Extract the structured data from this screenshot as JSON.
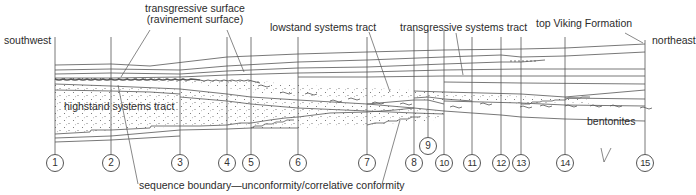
{
  "diagram": {
    "type": "stratigraphic cross-section",
    "labels": {
      "southwest": "southwest",
      "northeast": "northeast",
      "transgressive_surface_line1": "transgressive surface",
      "transgressive_surface_line2": "(ravinement surface)",
      "lowstand": "lowstand systems tract",
      "transgressive_tract": "transgressive systems tract",
      "top_viking": "top Viking Formation",
      "highstand": "highstand systems tract",
      "bentonites": "bentonites",
      "sequence_boundary": "sequence boundary—unconformity/correlative conformity"
    },
    "wells": [
      {
        "id": "1",
        "x": 55
      },
      {
        "id": "2",
        "x": 111
      },
      {
        "id": "3",
        "x": 180
      },
      {
        "id": "4",
        "x": 227
      },
      {
        "id": "5",
        "x": 251
      },
      {
        "id": "6",
        "x": 298
      },
      {
        "id": "7",
        "x": 367
      },
      {
        "id": "8",
        "x": 414
      },
      {
        "id": "9",
        "x": 428
      },
      {
        "id": "10",
        "x": 444
      },
      {
        "id": "11",
        "x": 472
      },
      {
        "id": "12",
        "x": 501
      },
      {
        "id": "13",
        "x": 521
      },
      {
        "id": "14",
        "x": 565
      },
      {
        "id": "15",
        "x": 645
      }
    ],
    "colors": {
      "line": "#555555",
      "text": "#2b2b2b",
      "background": "#ffffff"
    }
  }
}
